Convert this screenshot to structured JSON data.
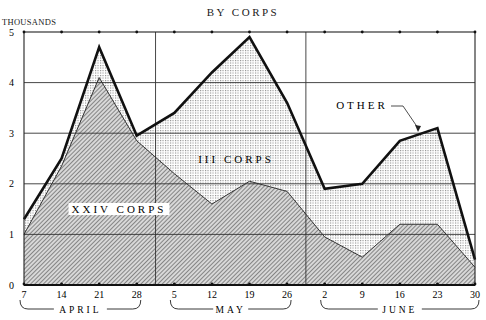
{
  "chart_data": {
    "type": "area",
    "title": "BY CORPS",
    "ylabel": "THOUSANDS",
    "xlabel": "",
    "ylim": [
      0,
      5
    ],
    "yticks": [
      "0",
      "1",
      "2",
      "3",
      "4",
      "5"
    ],
    "grid": true,
    "categories": [
      "7",
      "14",
      "21",
      "28",
      "5",
      "12",
      "19",
      "26",
      "2",
      "9",
      "16",
      "23",
      "30"
    ],
    "months": [
      {
        "label": "APRIL",
        "from": 0,
        "to": 3
      },
      {
        "label": "MAY",
        "from": 4,
        "to": 7
      },
      {
        "label": "JUNE",
        "from": 8,
        "to": 12
      }
    ],
    "stacked": true,
    "series": [
      {
        "name": "XXIV CORPS",
        "fill": "diagonal-hatch",
        "values": [
          1.0,
          2.35,
          4.1,
          2.85,
          2.2,
          1.6,
          2.05,
          1.85,
          0.95,
          0.55,
          1.2,
          1.2,
          0.35
        ]
      },
      {
        "name": "III CORPS",
        "fill": "dot-stipple",
        "values": [
          0.3,
          0.15,
          0.0,
          0.1,
          1.2,
          2.6,
          2.85,
          1.75,
          0.95,
          1.45,
          1.65,
          1.9,
          0.15
        ]
      },
      {
        "name": "OTHER",
        "fill": "none",
        "note": "thin band between III Corps and total line",
        "values": [
          0.0,
          0.0,
          0.6,
          0.0,
          0.0,
          0.0,
          0.0,
          0.0,
          0.0,
          0.0,
          0.0,
          0.0,
          0.0
        ]
      }
    ],
    "total": [
      1.3,
      2.5,
      4.7,
      2.95,
      3.4,
      4.2,
      4.9,
      3.6,
      1.9,
      2.0,
      2.85,
      3.1,
      0.5
    ],
    "annotations": [
      {
        "text": "XXIV CORPS",
        "target": "lower hatched area"
      },
      {
        "text": "III CORPS",
        "target": "stippled area"
      },
      {
        "text": "OTHER",
        "target": "total line (arrow to June 16-23 segment)"
      }
    ],
    "legend": "none (labels inline)"
  },
  "labels": {
    "title": "BY CORPS",
    "y_unit": "THOUSANDS",
    "xxiv": "XXIV CORPS",
    "iii": "III CORPS",
    "other": "OTHER",
    "april": "APRIL",
    "may": "MAY",
    "june": "JUNE"
  },
  "colors": {
    "ink": "#1a1a1a",
    "hatch_fill": "#cfcfcf",
    "stipple_fill": "#e4e4e4",
    "background": "#ffffff"
  }
}
